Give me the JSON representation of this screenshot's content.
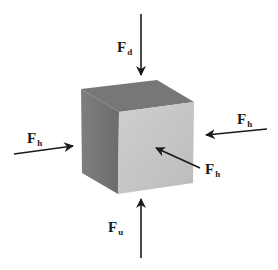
{
  "diagram": {
    "colors": {
      "top_face": "#7a7a7a",
      "left_face": "#777777",
      "front_face": "#c4c4c4",
      "arrow": "#1a1a1a",
      "background": "#ffffff"
    },
    "forces": [
      {
        "id": "down",
        "symbol": "F",
        "subscript": "d",
        "direction": "downward",
        "target": "top face"
      },
      {
        "id": "left",
        "symbol": "F",
        "subscript": "h",
        "direction": "rightward",
        "target": "left face"
      },
      {
        "id": "right",
        "symbol": "F",
        "subscript": "h",
        "direction": "leftward",
        "target": "right face"
      },
      {
        "id": "front",
        "symbol": "F",
        "subscript": "h",
        "direction": "into front face",
        "target": "front face"
      },
      {
        "id": "up",
        "symbol": "F",
        "subscript": "u",
        "direction": "upward",
        "target": "bottom face"
      }
    ]
  }
}
